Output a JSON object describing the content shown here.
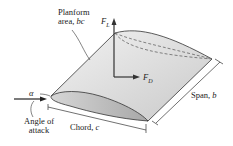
{
  "figure": {
    "labels": {
      "planform_line1": "Planform",
      "planform_line2": "area, ",
      "planform_var": "bc",
      "lift": "F",
      "lift_sub": "L",
      "drag": "F",
      "drag_sub": "D",
      "span": "Span, ",
      "span_var": "b",
      "chord": "Chord, ",
      "chord_var": "c",
      "alpha": "α",
      "angle_line1": "Angle of",
      "angle_line2": "attack"
    },
    "colors": {
      "wing_top": "#e6e6e6",
      "wing_side": "#c8c8c8",
      "outline": "#333333"
    }
  }
}
